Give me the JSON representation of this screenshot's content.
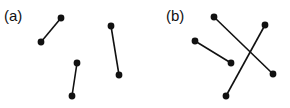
{
  "panels": [
    {
      "label": "(a)",
      "label_pos": [
        4,
        8
      ],
      "segments": [
        {
          "x1": 41,
          "y1": 42,
          "x2": 61,
          "y2": 18
        },
        {
          "x1": 111,
          "y1": 26,
          "x2": 119,
          "y2": 75
        },
        {
          "x1": 72,
          "y1": 96,
          "x2": 77,
          "y2": 63
        }
      ]
    },
    {
      "label": "(b)",
      "label_pos": [
        166,
        8
      ],
      "segments": [
        {
          "x1": 195,
          "y1": 41,
          "x2": 231,
          "y2": 63
        },
        {
          "x1": 214,
          "y1": 17,
          "x2": 273,
          "y2": 74
        },
        {
          "x1": 265,
          "y1": 25,
          "x2": 226,
          "y2": 96
        }
      ]
    }
  ],
  "style": {
    "stroke": "#111111",
    "stroke_width": 1.6,
    "dot_radius": 3.4
  }
}
